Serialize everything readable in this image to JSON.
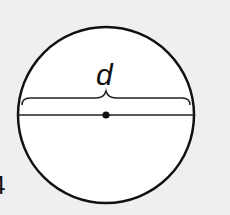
{
  "diagram": {
    "label": "d",
    "problem_number": "4",
    "shapes": {
      "circle": {
        "cx": 106,
        "cy": 115,
        "r": 88,
        "fill": "#ffffff",
        "stroke": "#111111"
      },
      "diameter": {
        "x1": 18,
        "y1": 115,
        "x2": 194,
        "y2": 115
      },
      "center_point": {
        "cx": 106,
        "cy": 115,
        "r": 3.5
      },
      "brace": {
        "from_x": 22,
        "to_x": 190,
        "y": 98
      }
    }
  }
}
